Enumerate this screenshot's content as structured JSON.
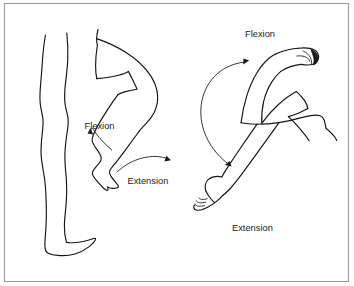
{
  "figure": {
    "background_color": "#ffffff",
    "line_color": "#141414",
    "frame_color": "#9a9a9a",
    "text_color": "#1b1b1b"
  },
  "frame": {
    "name": "diagram-border"
  },
  "panels": [
    {
      "id": "leg-panel",
      "subject": "leg",
      "description": "Side view of two legs, one straight and standing, one bent at the knee"
    },
    {
      "id": "arm-panel",
      "subject": "arm",
      "description": "Arm shown twice, flexed at the elbow with closed fist and extended downward with open hand"
    }
  ],
  "labels": {
    "leg_flexion": "Flexion",
    "leg_extension": "Extension",
    "arm_flexion": "Flexion",
    "arm_extension": "Extension"
  },
  "arrows": [
    {
      "name": "leg-flexion-arrow",
      "label": "Flexion",
      "direction": "up-left",
      "heads": 1
    },
    {
      "name": "leg-extension-arrow",
      "label": "Extension",
      "direction": "right",
      "heads": 1
    },
    {
      "name": "arm-range-arc",
      "label": "",
      "direction": "bidirectional-arc",
      "heads": 2
    }
  ]
}
